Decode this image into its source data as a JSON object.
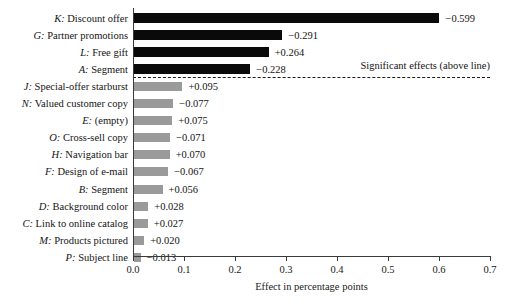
{
  "chart_data": {
    "type": "bar",
    "orientation": "horizontal",
    "title": "",
    "xlabel": "Effect in percentage points",
    "ylabel": "",
    "xlim": [
      0.0,
      0.7
    ],
    "xticks": [
      "0.0",
      "0.1",
      "0.2",
      "0.3",
      "0.4",
      "0.5",
      "0.6",
      "0.7"
    ],
    "xtick_values": [
      0.0,
      0.1,
      0.2,
      0.3,
      0.4,
      0.5,
      0.6,
      0.7
    ],
    "grid": false,
    "legend": false,
    "annotations": [
      {
        "text": "Significant effects (above line)",
        "kind": "divider-note"
      }
    ],
    "colors": {
      "significant": "#0a0a0a",
      "non_significant": "#9a9a9a",
      "axis": "#3a3a3a",
      "text": "#141414",
      "background": "#ffffff"
    },
    "categories": [
      "K: Discount offer",
      "G: Partner promotions",
      "L: Free gift",
      "A: Segment",
      "J: Special-offer starburst",
      "N: Valued customer copy",
      "E: (empty)",
      "O: Cross-sell copy",
      "H: Navigation bar",
      "F: Design of e-mail",
      "B: Segment",
      "D: Background color",
      "C: Link to online catalog",
      "M: Products pictured",
      "P: Subject line"
    ],
    "values": [
      0.599,
      0.291,
      0.264,
      0.228,
      0.095,
      0.077,
      0.075,
      0.071,
      0.07,
      0.067,
      0.056,
      0.028,
      0.027,
      0.02,
      0.013
    ],
    "bars": [
      {
        "key": "K",
        "name": "Discount offer",
        "label": "K: Discount offer",
        "value": 0.599,
        "value_label": "−0.599",
        "sign": "negative",
        "significant": true
      },
      {
        "key": "G",
        "name": "Partner promotions",
        "label": "G: Partner promotions",
        "value": 0.291,
        "value_label": "−0.291",
        "sign": "negative",
        "significant": true
      },
      {
        "key": "L",
        "name": "Free gift",
        "label": "L: Free gift",
        "value": 0.264,
        "value_label": "+0.264",
        "sign": "positive",
        "significant": true
      },
      {
        "key": "A",
        "name": "Segment",
        "label": "A: Segment",
        "value": 0.228,
        "value_label": "−0.228",
        "sign": "negative",
        "significant": true
      },
      {
        "key": "J",
        "name": "Special-offer starburst",
        "label": "J: Special-offer starburst",
        "value": 0.095,
        "value_label": "+0.095",
        "sign": "positive",
        "significant": false
      },
      {
        "key": "N",
        "name": "Valued customer copy",
        "label": "N: Valued customer copy",
        "value": 0.077,
        "value_label": "−0.077",
        "sign": "negative",
        "significant": false
      },
      {
        "key": "E",
        "name": "(empty)",
        "label": "E: (empty)",
        "value": 0.075,
        "value_label": "+0.075",
        "sign": "positive",
        "significant": false
      },
      {
        "key": "O",
        "name": "Cross-sell copy",
        "label": "O: Cross-sell copy",
        "value": 0.071,
        "value_label": "−0.071",
        "sign": "negative",
        "significant": false
      },
      {
        "key": "H",
        "name": "Navigation bar",
        "label": "H: Navigation bar",
        "value": 0.07,
        "value_label": "+0.070",
        "sign": "positive",
        "significant": false
      },
      {
        "key": "F",
        "name": "Design of e-mail",
        "label": "F: Design of e-mail",
        "value": 0.067,
        "value_label": "−0.067",
        "sign": "negative",
        "significant": false
      },
      {
        "key": "B",
        "name": "Segment",
        "label": "B: Segment",
        "value": 0.056,
        "value_label": "+0.056",
        "sign": "positive",
        "significant": false
      },
      {
        "key": "D",
        "name": "Background color",
        "label": "D: Background color",
        "value": 0.028,
        "value_label": "+0.028",
        "sign": "positive",
        "significant": false
      },
      {
        "key": "C",
        "name": "Link to online catalog",
        "label": "C: Link to online catalog",
        "value": 0.027,
        "value_label": "+0.027",
        "sign": "positive",
        "significant": false
      },
      {
        "key": "M",
        "name": "Products pictured",
        "label": "M: Products pictured",
        "value": 0.02,
        "value_label": "+0.020",
        "sign": "positive",
        "significant": false
      },
      {
        "key": "P",
        "name": "Subject line",
        "label": "P: Subject line",
        "value": 0.013,
        "value_label": "−0.013",
        "sign": "negative",
        "significant": false
      }
    ]
  }
}
